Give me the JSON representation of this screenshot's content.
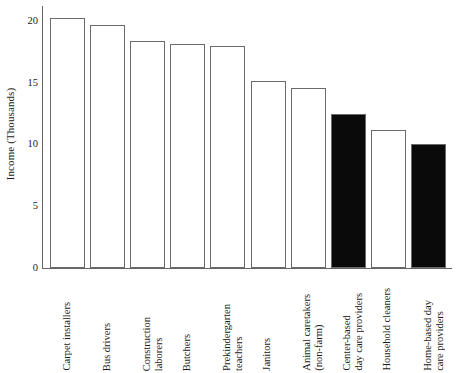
{
  "chart_data": {
    "type": "bar",
    "title": "",
    "subtitle": "",
    "xlabel": "",
    "ylabel": "Income (Thousands)",
    "categories": [
      "Carpet installers",
      "Bus drivers",
      "Construction laborers",
      "Butchers",
      "Prekindergarten teachers",
      "Janitors",
      "Animal caretakers (non-farm)",
      "Center-based day care providers",
      "Household cleaners",
      "Home-based day care providers"
    ],
    "category_lines": [
      [
        "Carpet installers"
      ],
      [
        "Bus drivers"
      ],
      [
        "Construction",
        "laborers"
      ],
      [
        "Butchers"
      ],
      [
        "Prekindergarten",
        "teachers"
      ],
      [
        "Janitors"
      ],
      [
        "Animal caretakers",
        "(non-farm)"
      ],
      [
        "Center-based",
        "day care providers"
      ],
      [
        "Household cleaners"
      ],
      [
        "Home-based day",
        "care providers"
      ]
    ],
    "values": [
      20.2,
      19.7,
      18.4,
      18.1,
      18.0,
      15.1,
      14.6,
      12.5,
      11.2,
      10.0
    ],
    "bar_styles": [
      "open",
      "open",
      "open",
      "open",
      "open",
      "open",
      "open",
      "filled",
      "open",
      "filled"
    ],
    "ylim": [
      0,
      21.2
    ],
    "yticks": [
      0,
      5,
      10,
      15,
      20
    ],
    "ytick_labels": [
      "0",
      "5",
      "10",
      "15",
      "20"
    ],
    "grid": false,
    "legend": null,
    "colors": {
      "bar_open_fill": "#ffffff",
      "bar_filled_fill": "#0a0a0a",
      "bar_stroke": "#6b6b6b",
      "axis": "#666666",
      "text": "#1a1a1a",
      "background": "#ffffff"
    }
  }
}
